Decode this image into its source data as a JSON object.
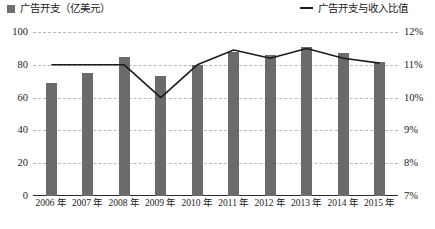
{
  "legend": {
    "bar_series": "广告开支（亿美元）",
    "line_series": "广告开支与收入比值",
    "bar_color": "#6b6b6b",
    "line_color": "#1c1c1c"
  },
  "chart_data": {
    "type": "bar",
    "title": "",
    "xlabel": "",
    "ylabel": "",
    "grid": true,
    "legend_position": "top",
    "categories": [
      "2006 年",
      "2007 年",
      "2008 年",
      "2009 年",
      "2010 年",
      "2011 年",
      "2012 年",
      "2013 年",
      "2014 年",
      "2015 年"
    ],
    "axes": {
      "left": {
        "label": "",
        "ticks": [
          0,
          20,
          40,
          60,
          80,
          100
        ],
        "tick_labels": [
          "0",
          "20",
          "40",
          "60",
          "80",
          "100"
        ],
        "ylim": [
          0,
          100
        ]
      },
      "right": {
        "label": "",
        "ticks": [
          7,
          8,
          9,
          10,
          11,
          12
        ],
        "tick_labels": [
          "7%",
          "8%",
          "9%",
          "10%",
          "11%",
          "12%"
        ],
        "ylim": [
          7,
          12
        ]
      }
    },
    "series": [
      {
        "name": "广告开支（亿美元）",
        "type": "bar",
        "axis": "left",
        "unit": "亿美元",
        "values": [
          69,
          75,
          85,
          73,
          80,
          88,
          86,
          91,
          87,
          82
        ]
      },
      {
        "name": "广告开支与收入比值",
        "type": "line",
        "axis": "right",
        "unit": "%",
        "values": [
          11.0,
          11.0,
          11.0,
          10.0,
          11.0,
          11.45,
          11.2,
          11.5,
          11.2,
          11.05
        ]
      }
    ]
  }
}
